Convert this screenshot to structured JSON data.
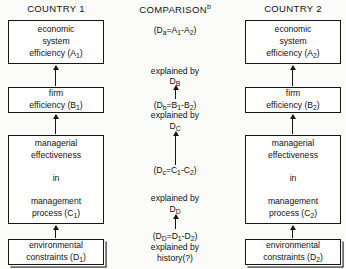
{
  "headers": {
    "left": "COUNTRY 1",
    "center": "COMPARISON",
    "center_superscript": "b",
    "right": "COUNTRY 2"
  },
  "colors": {
    "background": "#fbfbf9",
    "ink": "#161616",
    "box_fill": "#ffffff"
  },
  "left_column": {
    "boxes": [
      {
        "name": "economic-system-efficiency",
        "line1": "economic",
        "line2": "system",
        "line3_pre": "efficiency (A",
        "line3_sub": "1",
        "line3_post": ")"
      },
      {
        "name": "firm-efficiency",
        "line1": "firm",
        "line3_pre": "efficiency (B",
        "line3_sub": "1",
        "line3_post": ")"
      },
      {
        "name": "managerial-effectiveness",
        "line1": "managerial",
        "line2": "effectiveness",
        "line_mid": "in",
        "line4": "management",
        "line5_pre": "process (C",
        "line5_sub": "1",
        "line5_post": ")"
      },
      {
        "name": "environmental-constraints",
        "line1": "environmental",
        "line2_pre": "constraints (D",
        "line2_sub": "1",
        "line2_post": ")"
      }
    ]
  },
  "right_column": {
    "boxes": [
      {
        "name": "economic-system-efficiency",
        "line1": "economic",
        "line2": "system",
        "line3_pre": "efficiency  (A",
        "line3_sub": "2",
        "line3_post": ")"
      },
      {
        "name": "firm-efficiency",
        "line1": "firm",
        "line3_pre": "efficiency (B",
        "line3_sub": "2",
        "line3_post": ")"
      },
      {
        "name": "managerial-effectiveness",
        "line1": "managerial",
        "line2": "effectiveness",
        "line_mid": "in",
        "line4": "management",
        "line5_pre": "process (C",
        "line5_sub": "2",
        "line5_post": ")"
      },
      {
        "name": "environmental-constraints",
        "line1": "environmental",
        "line2_pre": "constraints (D",
        "line2_sub": "2",
        "line2_post": ")"
      }
    ]
  },
  "center_column": {
    "line_da_pre": "(D",
    "line_da_sub": "a",
    "line_da_post": "=A",
    "line_da_sub2": "1",
    "line_da_post2": "-A",
    "line_da_sub3": "2",
    "line_da_post3": ")",
    "explained_by_1": "explained by",
    "label_DB_pre": "D",
    "label_DB_sub": "B",
    "line_db_pre": "(D",
    "line_db_sub": "b",
    "line_db_post": "=B",
    "line_db_sub2": "1",
    "line_db_post2": "-B",
    "line_db_sub3": "2",
    "line_db_post3": ")",
    "explained_by_2": "explained by",
    "label_DC_pre": "D",
    "label_DC_sub": "C",
    "line_dc_pre": "(D",
    "line_dc_sub": "c",
    "line_dc_post": "=C",
    "line_dc_sub2": "1",
    "line_dc_post2": "-C",
    "line_dc_sub3": "2",
    "line_dc_post3": ")",
    "explained_by_3": "explained by",
    "label_DD_pre": "D",
    "label_DD_sub": "D",
    "line_dd_pre": "(D",
    "line_dd_sub": "D",
    "line_dd_post": "=D",
    "line_dd_sub2": "1",
    "line_dd_post2": "-D",
    "line_dd_sub3": "2",
    "line_dd_post3": ")",
    "explained_by_4": "explained  by",
    "history": "history(?)"
  },
  "diagram_data": {
    "type": "flow-comparison-diagram",
    "columns": 3,
    "levels": [
      "A",
      "B",
      "C",
      "D"
    ],
    "relations": [
      "D1 -> C1 -> B1 -> A1",
      "D2 -> C2 -> B2 -> A2",
      "Da = A1-A2 explained by DB",
      "Db = B1-B2 explained by DC",
      "Dc = C1-C2 explained by DD",
      "DD = D1-D2 explained by history(?)"
    ]
  }
}
